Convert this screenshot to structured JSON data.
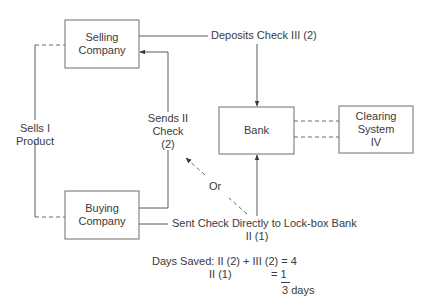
{
  "diagram": {
    "nodes": {
      "selling_company": {
        "line1": "Selling",
        "line2": "Company"
      },
      "buying_company": {
        "line1": "Buying",
        "line2": "Company"
      },
      "bank": {
        "label": "Bank"
      },
      "clearing_system": {
        "line1": "Clearing",
        "line2": "System",
        "line3": "IV"
      }
    },
    "edges": {
      "sells_product": {
        "line1": "Sells I",
        "line2": "Product"
      },
      "sends_check": {
        "line1": "Sends II",
        "line2": "Check",
        "line3": "(2)"
      },
      "deposits_check": {
        "label": "Deposits Check III (2)"
      },
      "sent_directly": {
        "line1": "Sent Check Directly to Lock-box Bank",
        "line2": "II (1)"
      },
      "or": {
        "label": "Or"
      }
    },
    "calculation": {
      "line1": "Days Saved: II (2) + III (2) = 4",
      "line2_left": "II (1)",
      "line2_right": "= 1",
      "total": "3 days"
    },
    "colors": {
      "line": "#5a5a5a",
      "text": "#3a3a3a",
      "background": "#ffffff"
    }
  }
}
